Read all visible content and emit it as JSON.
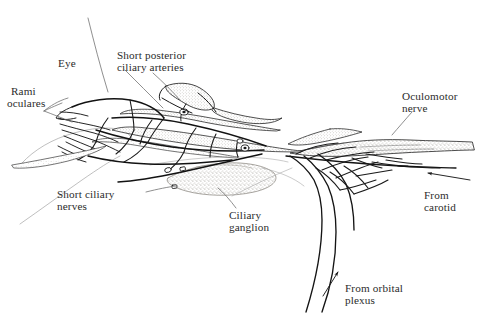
{
  "figure": {
    "kind": "anatomical-line-drawing",
    "width": 478,
    "height": 317,
    "background_color": "#ffffff",
    "ink_color": "#1a1a1a",
    "text_color": "#2b2b2b",
    "stipple_color": "#8c8880",
    "faint_line_color": "#9a9a9a"
  },
  "labels": {
    "eye": "Eye",
    "rami_oculares_line1": "Rami",
    "rami_oculares_line2": "oculares",
    "short_posterior_line1": "Short posterior",
    "short_posterior_line2": "ciliary arteries",
    "short_ciliary_line1": "Short ciliary",
    "short_ciliary_line2": "nerves",
    "ciliary_ganglion_line1": "Ciliary",
    "ciliary_ganglion_line2": "ganglion",
    "oculomotor_line1": "Oculomotor",
    "oculomotor_line2": "nerve",
    "from_carotid_line1": "From",
    "from_carotid_line2": "carotid",
    "from_orbital_line1": "From orbital",
    "from_orbital_line2": "plexus"
  },
  "structures": [
    {
      "name": "eye-globe",
      "description": "Eye globe outline at left, faint sweeping contour"
    },
    {
      "name": "ciliary-ganglion",
      "description": "Stippled oval ganglion body in lower middle"
    },
    {
      "name": "oculomotor-nerve",
      "description": "Broad stippled nerve trunk entering from right"
    },
    {
      "name": "short-posterior-ciliary-arteries",
      "description": "Stippled arteries fanning toward the globe"
    },
    {
      "name": "short-ciliary-nerves",
      "description": "Fine nerve filaments radiating to the globe"
    },
    {
      "name": "rami-oculares",
      "description": "Ocular rami converging at left pole"
    },
    {
      "name": "carotid-plexus-input",
      "description": "Branch entering from the carotid plexus, right"
    },
    {
      "name": "orbital-plexus-input",
      "description": "Branches ascending from the orbital plexus, bottom"
    }
  ],
  "arrows": [
    {
      "name": "from-carotid-arrow",
      "direction": "points-left"
    },
    {
      "name": "from-orbital-plexus-arrow",
      "direction": "points-up-right"
    },
    {
      "name": "rami-oculares-arrow",
      "direction": "points-left"
    }
  ]
}
